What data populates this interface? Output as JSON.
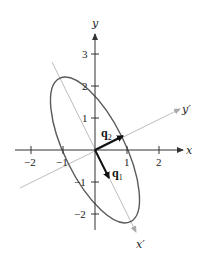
{
  "diagram": {
    "type": "ellipse with principal axes",
    "colors": {
      "axes": "#333333",
      "rotated_axes": "#b8b8b8",
      "ellipse": "#555555",
      "vectors": "#111111"
    },
    "axes": {
      "x_label": "x",
      "y_label": "y",
      "x_ticks": [
        {
          "value": -2,
          "label": "−2"
        },
        {
          "value": -1,
          "label": "−1"
        },
        {
          "value": 1,
          "label": "1"
        },
        {
          "value": 2,
          "label": "2"
        }
      ],
      "y_ticks": [
        {
          "value": 3,
          "label": "3"
        },
        {
          "value": 2,
          "label": "2"
        },
        {
          "value": 1,
          "label": "1"
        },
        {
          "value": -1,
          "label": "−1"
        },
        {
          "value": -2,
          "label": "−2"
        }
      ]
    },
    "rotated_axes": {
      "x_prime_label": "x′",
      "y_prime_label": "y′"
    },
    "vectors": {
      "q1": {
        "label": "q",
        "subscript": "1"
      },
      "q2": {
        "label": "q",
        "subscript": "2"
      }
    }
  }
}
